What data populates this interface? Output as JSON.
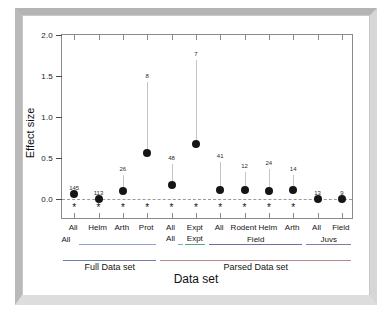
{
  "figure": {
    "frame_color": "#c9c9c9",
    "background": "#ffffff"
  },
  "axes": {
    "y_title": "Effect size",
    "x_title": "Data set",
    "y_ticks": [
      "2.0",
      "1.5",
      "1.0",
      "0.5",
      "0.0"
    ],
    "y_tick_values": [
      2.0,
      1.5,
      1.0,
      0.5,
      0.0
    ],
    "zero_reference_line": "dashed"
  },
  "groups_level1": [
    {
      "label": "All",
      "color": "#8fa0d8",
      "start_index": 0,
      "end_index": 3
    },
    {
      "label": "All",
      "color": "#8fa0d8",
      "start_index": 4,
      "end_index": 4
    },
    {
      "label": "Expt",
      "color": "#5aa77a",
      "start_index": 5,
      "end_index": 5
    },
    {
      "label": "Field",
      "color": "#6f6f9e",
      "start_index": 6,
      "end_index": 9
    },
    {
      "label": "Juvs",
      "color": "#7e7ea8",
      "start_index": 10,
      "end_index": 11
    }
  ],
  "groups_level2": [
    {
      "label": "Full Data set",
      "color": "#6b7fae",
      "start_index": 0,
      "end_index": 3
    },
    {
      "label": "Parsed Data set",
      "color": "#b98a8a",
      "start_index": 4,
      "end_index": 11
    }
  ],
  "chart_data": {
    "type": "scatter",
    "title": "",
    "subtitle": "",
    "xlabel": "Data set",
    "ylabel": "Effect size",
    "ylim": [
      -0.25,
      2.0
    ],
    "yticks": [
      0.0,
      0.5,
      1.0,
      1.5,
      2.0
    ],
    "grid": false,
    "legend": "none",
    "reference_line": {
      "y": 0.0,
      "style": "dashed",
      "color": "#9a9a9a"
    },
    "categories": [
      "All",
      "Helm",
      "Arth",
      "Prot",
      "All",
      "Expt",
      "All",
      "Rodent",
      "Helm",
      "Arth",
      "All",
      "Field"
    ],
    "points": [
      {
        "category": "All",
        "effect_size": 0.07,
        "n": 145,
        "ci_upper": 0.07,
        "significant": true
      },
      {
        "category": "Helm",
        "effect_size": 0.01,
        "n": 113,
        "ci_upper": 0.01,
        "significant": true
      },
      {
        "category": "Arth",
        "effect_size": 0.1,
        "n": 26,
        "ci_upper": 0.3,
        "significant": true
      },
      {
        "category": "Prot",
        "effect_size": 0.56,
        "n": 8,
        "ci_upper": 1.43,
        "significant": true
      },
      {
        "category": "All",
        "effect_size": 0.17,
        "n": 48,
        "ci_upper": 0.43,
        "significant": true
      },
      {
        "category": "Expt",
        "effect_size": 0.67,
        "n": 7,
        "ci_upper": 1.7,
        "significant": true
      },
      {
        "category": "All",
        "effect_size": 0.12,
        "n": 41,
        "ci_upper": 0.45,
        "significant": true
      },
      {
        "category": "Rodent",
        "effect_size": 0.11,
        "n": 12,
        "ci_upper": 0.33,
        "significant": true
      },
      {
        "category": "Helm",
        "effect_size": 0.1,
        "n": 24,
        "ci_upper": 0.37,
        "significant": true
      },
      {
        "category": "Arth",
        "effect_size": 0.11,
        "n": 14,
        "ci_upper": 0.3,
        "significant": true
      },
      {
        "category": "All",
        "effect_size": 0.01,
        "n": 13,
        "ci_upper": 0.01,
        "significant": false
      },
      {
        "category": "Field",
        "effect_size": 0.01,
        "n": 9,
        "ci_upper": 0.01,
        "significant": false
      }
    ],
    "significance_marker": "*",
    "marker_color": "#151515",
    "errorbar_color": "#c4c4c4"
  }
}
